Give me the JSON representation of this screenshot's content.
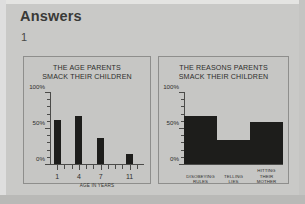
{
  "page": {
    "heading": "Answers",
    "question_number": "1",
    "background_color": "#c9c9c7",
    "ink_color": "#1d1d1b"
  },
  "chart_data": [
    {
      "type": "bar",
      "panel": "left",
      "title": "THE AGE PARENTS\nSMACK THEIR CHILDREN",
      "title_line1": "THE AGE PARENTS",
      "title_line2": "SMACK THEIR CHILDREN",
      "xlabel": "AGE IN YEARS",
      "ylabel": "",
      "ylim": [
        0,
        100
      ],
      "yticks": [
        0,
        50,
        100
      ],
      "ytick_labels": [
        "0%",
        "50%",
        "100%"
      ],
      "grid": false,
      "legend": "none",
      "xticks": [
        1,
        4,
        7,
        11
      ],
      "xtick_labels": [
        "1",
        "4",
        "7",
        "11"
      ],
      "xlim": [
        0,
        13
      ],
      "categories": [
        "1",
        "4",
        "7",
        "11"
      ],
      "values": [
        62,
        68,
        37,
        15
      ]
    },
    {
      "type": "bar",
      "panel": "right",
      "title": "THE REASONS PARENTS\nSMACK THEIR CHILDREN",
      "title_line1": "THE REASONS PARENTS",
      "title_line2": "SMACK THEIR CHILDREN",
      "xlabel": "",
      "ylabel": "",
      "ylim": [
        0,
        100
      ],
      "yticks": [
        0,
        50,
        100
      ],
      "ytick_labels": [
        "0%",
        "50%",
        "100%"
      ],
      "grid": false,
      "legend": "none",
      "categories": [
        "DISOBEYING\nRULES",
        "TELLING\nLIES",
        "HITTING\nTHEIR\nMOTHER"
      ],
      "values": [
        68,
        35,
        60
      ]
    }
  ]
}
